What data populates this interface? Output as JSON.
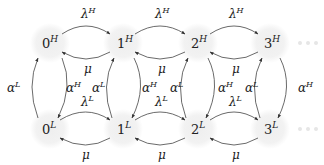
{
  "diagram": {
    "type": "markov-chain",
    "background_color": "#ffffff",
    "node_fill_color": "#f2f2f2",
    "edge_color": "#444444",
    "nodes_high": [
      {
        "id": "0H",
        "base": "0",
        "sup": "H"
      },
      {
        "id": "1H",
        "base": "1",
        "sup": "H"
      },
      {
        "id": "2H",
        "base": "2",
        "sup": "H"
      },
      {
        "id": "3H",
        "base": "3",
        "sup": "H"
      }
    ],
    "nodes_low": [
      {
        "id": "0L",
        "base": "0",
        "sup": "L"
      },
      {
        "id": "1L",
        "base": "1",
        "sup": "L"
      },
      {
        "id": "2L",
        "base": "2",
        "sup": "L"
      },
      {
        "id": "3L",
        "base": "3",
        "sup": "L"
      }
    ],
    "edge_labels": {
      "arrival_high": {
        "base": "λ",
        "sup": "H"
      },
      "arrival_low": {
        "base": "λ",
        "sup": "L"
      },
      "service": {
        "base": "μ"
      },
      "switch_to_high": {
        "base": "α",
        "sup": "L"
      },
      "switch_to_low": {
        "base": "α",
        "sup": "H"
      }
    },
    "continuation": "ellipsis-dots"
  }
}
